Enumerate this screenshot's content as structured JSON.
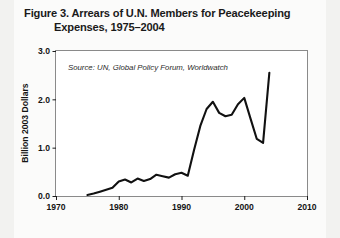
{
  "figure": {
    "title_line1": "Figure 3. Arrears of U.N. Members for Peacekeeping",
    "title_line2": "Expenses, 1975–2004",
    "source": "Source: UN, Global Policy Forum, Worldwatch"
  },
  "colors": {
    "page_background": "#f2f2f0",
    "card_background": "#fbfbfa",
    "plot_background": "#ffffff",
    "line": "#111111",
    "frame": "#8a8a8a",
    "text": "#141414"
  },
  "chart_data": {
    "type": "line",
    "title": "Figure 3. Arrears of U.N. Members for Peacekeeping Expenses, 1975–2004",
    "xlabel": "",
    "ylabel": "Billion 2003 Dollars",
    "annotation": "Source: UN, Global Policy Forum, Worldwatch",
    "grid": false,
    "legend": "none",
    "xlim": [
      1970,
      2010
    ],
    "ylim": [
      0.0,
      3.0
    ],
    "xticks": [
      1970,
      1980,
      1990,
      2000,
      2010
    ],
    "xticklabels": [
      "1970",
      "1980",
      "1990",
      "2000",
      "2010"
    ],
    "yticks": [
      0.0,
      1.0,
      2.0,
      3.0
    ],
    "yticklabels": [
      "0.0",
      "1.0",
      "2.0",
      "3.0"
    ],
    "x": [
      1975,
      1976,
      1977,
      1978,
      1979,
      1980,
      1981,
      1982,
      1983,
      1984,
      1985,
      1986,
      1987,
      1988,
      1989,
      1990,
      1991,
      1992,
      1993,
      1994,
      1995,
      1996,
      1997,
      1998,
      1999,
      2000,
      2001,
      2002,
      2003,
      2004
    ],
    "values": [
      0.02,
      0.05,
      0.09,
      0.13,
      0.17,
      0.3,
      0.34,
      0.28,
      0.36,
      0.31,
      0.35,
      0.44,
      0.41,
      0.38,
      0.45,
      0.48,
      0.42,
      0.95,
      1.45,
      1.8,
      1.95,
      1.72,
      1.65,
      1.68,
      1.9,
      2.03,
      1.6,
      1.18,
      1.1,
      2.55
    ],
    "series": [
      {
        "name": "Arrears of U.N. Members for Peacekeeping Expenses",
        "units": "Billion 2003 Dollars",
        "values": [
          0.02,
          0.05,
          0.09,
          0.13,
          0.17,
          0.3,
          0.34,
          0.28,
          0.36,
          0.31,
          0.35,
          0.44,
          0.41,
          0.38,
          0.45,
          0.48,
          0.42,
          0.95,
          1.45,
          1.8,
          1.95,
          1.72,
          1.65,
          1.68,
          1.9,
          2.03,
          1.6,
          1.18,
          1.1,
          2.55
        ]
      }
    ]
  }
}
